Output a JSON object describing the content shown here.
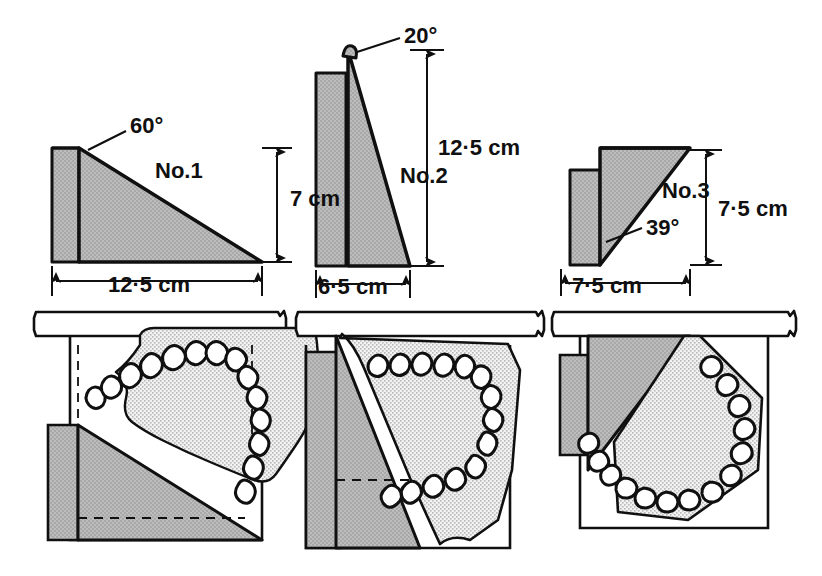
{
  "figure": {
    "background_color": "#ffffff",
    "ink_color": "#101010",
    "wedge_fill_color": "#b5b5b5",
    "cast_fill_color": "#e3e3e3",
    "table_fill_color": "#ffffff"
  },
  "wedges": [
    {
      "id": "no1",
      "name_label": "No.1",
      "angle_label": "60°",
      "height_label": "7 cm",
      "base_label": "12·5 cm",
      "orientation": "apex-top-left, long shallow slope to the right"
    },
    {
      "id": "no2",
      "name_label": "No.2",
      "angle_label": "20°",
      "height_label": "12·5 cm",
      "base_label": "6·5 cm",
      "orientation": "tall narrow wedge, apex at top with small rounded tab"
    },
    {
      "id": "no3",
      "name_label": "No.3",
      "angle_label": "39°",
      "height_label": "7·5 cm",
      "base_label": "7·5 cm",
      "orientation": "right triangle, apex bottom-left, slope rising to the right"
    }
  ],
  "plan_views": [
    {
      "id": "plan-no1",
      "for_wedge": "No.1",
      "description": "Dental cast resting on wedge No.1 against table edge",
      "tooth_count": 14,
      "has_dashed_hidden_lines": true
    },
    {
      "id": "plan-no2",
      "for_wedge": "No.2",
      "description": "Dental cast resting on wedge No.2 against table edge",
      "tooth_count": 14,
      "has_dashed_hidden_lines": true
    },
    {
      "id": "plan-no3",
      "for_wedge": "No.3",
      "description": "Dental cast resting on wedge No.3 against table edge",
      "tooth_count": 14,
      "has_dashed_hidden_lines": false
    }
  ],
  "table_edges": [
    {
      "id": "table-edge-1",
      "label": "work surface edge"
    },
    {
      "id": "table-edge-2",
      "label": "work surface edge"
    },
    {
      "id": "table-edge-3",
      "label": "work surface edge"
    }
  ]
}
